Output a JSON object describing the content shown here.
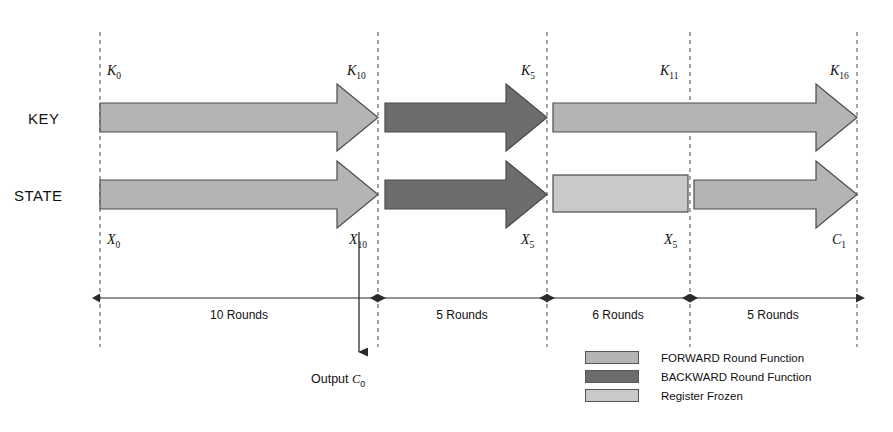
{
  "diagram": {
    "rows": [
      {
        "name": "key-row",
        "label": "KEY"
      },
      {
        "name": "state-row",
        "label": "STATE"
      }
    ],
    "node_labels": {
      "key_start": {
        "base": "K",
        "sub": "0"
      },
      "key_s1_end": {
        "base": "K",
        "sub": "10"
      },
      "key_s2_end": {
        "base": "K",
        "sub": "5"
      },
      "key_s3_mid": {
        "base": "K",
        "sub": "11"
      },
      "key_s4_end": {
        "base": "K",
        "sub": "16"
      },
      "state_start": {
        "base": "X",
        "sub": "0"
      },
      "state_s1_end": {
        "base": "X",
        "sub": "10"
      },
      "state_s2_end": {
        "base": "X",
        "sub": "5"
      },
      "state_s3_end": {
        "base": "X",
        "sub": "5"
      },
      "state_s4_end": {
        "base": "C",
        "sub": "1"
      }
    },
    "output": {
      "text": "Output ",
      "base": "C",
      "sub": "0"
    },
    "segments": [
      {
        "name": "segment-1",
        "rounds_label": "10 Rounds",
        "rounds": 10,
        "direction": "forward"
      },
      {
        "name": "segment-2",
        "rounds_label": "5 Rounds",
        "rounds": 5,
        "direction": "backward"
      },
      {
        "name": "segment-3",
        "rounds_label": "6 Rounds",
        "rounds": 6,
        "direction": "forward"
      },
      {
        "name": "segment-4",
        "rounds_label": "5 Rounds",
        "rounds": 5,
        "direction": "forward"
      }
    ],
    "legend": [
      {
        "name": "legend-forward",
        "label": "FORWARD Round Function",
        "color": "#b4b4b4"
      },
      {
        "name": "legend-backward",
        "label": "BACKWARD Round Function",
        "color": "#6d6d6d"
      },
      {
        "name": "legend-frozen",
        "label": "Register Frozen",
        "color": "#c9c9c9"
      }
    ],
    "colors": {
      "forward": "#b4b4b4",
      "backward": "#6d6d6d",
      "frozen": "#c9c9c9",
      "outline": "#4a4a4a",
      "guide": "#6b6b6b",
      "axis": "#2b2b2b",
      "background": "#ffffff"
    }
  }
}
